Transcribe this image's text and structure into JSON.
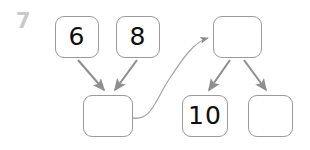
{
  "page": {
    "question_number": "7",
    "background_color": "#ffffff",
    "node_border_color": "#9a9a9a",
    "arrow_color": "#8f8f8f",
    "curve_color": "#a8a8a8",
    "label_color": "#0e0e0e",
    "question_number_color": "#c9c9c9"
  },
  "diagram": {
    "type": "node-link-diagram",
    "nodes": [
      {
        "id": "n-six",
        "label": "6",
        "x": 55,
        "y": 16,
        "w": 44,
        "h": 42,
        "empty": false
      },
      {
        "id": "n-eight",
        "label": "8",
        "x": 116,
        "y": 16,
        "w": 44,
        "h": 42,
        "empty": false
      },
      {
        "id": "n-left-child",
        "label": "",
        "x": 83,
        "y": 95,
        "w": 50,
        "h": 42,
        "empty": true
      },
      {
        "id": "n-right-root",
        "label": "",
        "x": 213,
        "y": 16,
        "w": 49,
        "h": 42,
        "empty": true
      },
      {
        "id": "n-ten",
        "label": "10",
        "x": 182,
        "y": 95,
        "w": 46,
        "h": 42,
        "empty": false
      },
      {
        "id": "n-right-empty",
        "label": "",
        "x": 248,
        "y": 95,
        "w": 45,
        "h": 42,
        "empty": true
      }
    ],
    "edges": [
      {
        "id": "e-six-to-left",
        "from": "n-six",
        "to": "n-left-child",
        "style": "straight",
        "arrowhead": true
      },
      {
        "id": "e-eight-to-left",
        "from": "n-eight",
        "to": "n-left-child",
        "style": "straight",
        "arrowhead": true
      },
      {
        "id": "e-left-to-rightroot",
        "from": "n-left-child",
        "to": "n-right-root",
        "style": "curved",
        "arrowhead": true
      },
      {
        "id": "e-rightroot-to-ten",
        "from": "n-right-root",
        "to": "n-ten",
        "style": "straight",
        "arrowhead": true
      },
      {
        "id": "e-rightroot-to-empty",
        "from": "n-right-root",
        "to": "n-right-empty",
        "style": "straight",
        "arrowhead": true
      }
    ]
  }
}
